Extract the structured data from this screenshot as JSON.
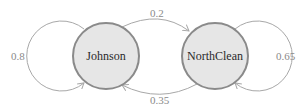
{
  "diagram": {
    "type": "markov-chain",
    "colors": {
      "node_fill": "#e6e6e6",
      "node_stroke": "#8a8a8a",
      "edge": "#a8a8a8",
      "label_text": "#2a2a2a",
      "prob_text": "#8a8a8a"
    },
    "nodes": [
      {
        "id": "johnson",
        "label": "Johnson"
      },
      {
        "id": "northclean",
        "label": "NorthClean"
      }
    ],
    "edges": [
      {
        "from": "Johnson",
        "to": "NorthClean",
        "label": "0.2"
      },
      {
        "from": "NorthClean",
        "to": "Johnson",
        "label": "0.35"
      },
      {
        "from": "Johnson",
        "to": "Johnson",
        "label": "0.8"
      },
      {
        "from": "NorthClean",
        "to": "NorthClean",
        "label": "0.65"
      }
    ]
  }
}
